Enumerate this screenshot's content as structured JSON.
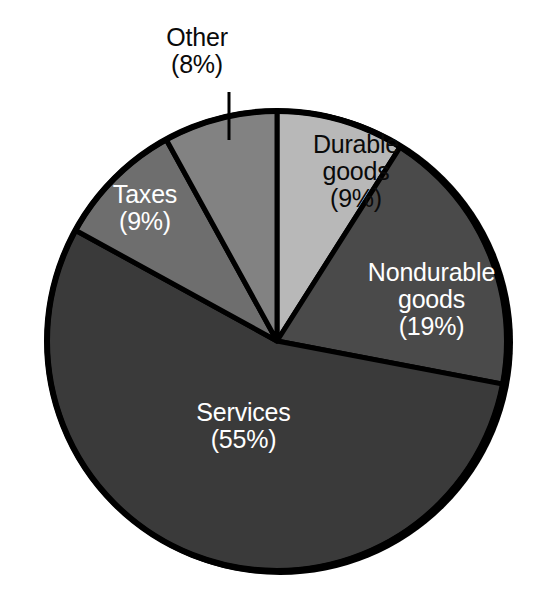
{
  "chart_data": {
    "type": "pie",
    "title": "",
    "subtitle": "",
    "xlabel": "",
    "ylabel": "",
    "legend_position": "none",
    "grid": false,
    "units": "percent",
    "total": 100,
    "start_angle_deg": 0,
    "direction": "clockwise",
    "categories": [
      "Durable goods",
      "Nondurable goods",
      "Services",
      "Taxes",
      "Other"
    ],
    "values": [
      9,
      19,
      55,
      9,
      8
    ],
    "slices": [
      {
        "name": "Durable goods",
        "label_line1": "Durable",
        "label_line2": "goods",
        "value": 9,
        "percent_text": "(9%)",
        "color": "#b8b8b8",
        "text_color": "#0a0a0a",
        "label_placement": "inside",
        "start_deg": 0,
        "end_deg": 32.4
      },
      {
        "name": "Nondurable goods",
        "label_line1": "Nondurable",
        "label_line2": "goods",
        "value": 19,
        "percent_text": "(19%)",
        "color": "#4a4a4a",
        "text_color": "#ffffff",
        "label_placement": "inside",
        "start_deg": 32.4,
        "end_deg": 100.8
      },
      {
        "name": "Services",
        "label_line1": "Services",
        "label_line2": "",
        "value": 55,
        "percent_text": "(55%)",
        "color": "#3a3a3a",
        "text_color": "#ffffff",
        "label_placement": "inside",
        "start_deg": 100.8,
        "end_deg": 298.8
      },
      {
        "name": "Taxes",
        "label_line1": "Taxes",
        "label_line2": "",
        "value": 9,
        "percent_text": "(9%)",
        "color": "#6e6e6e",
        "text_color": "#ffffff",
        "label_placement": "inside",
        "start_deg": 298.8,
        "end_deg": 331.2
      },
      {
        "name": "Other",
        "label_line1": "Other",
        "label_line2": "",
        "value": 8,
        "percent_text": "(8%)",
        "color": "#828282",
        "text_color": "#0a0a0a",
        "label_placement": "outside-callout",
        "start_deg": 331.2,
        "end_deg": 360
      }
    ]
  },
  "chart": {
    "outline_color": "#000000",
    "background_color": "#ffffff",
    "leader_line_color": "#000000"
  }
}
